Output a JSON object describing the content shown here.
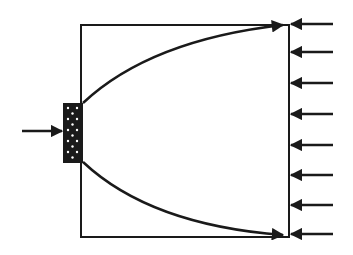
{
  "diagram": {
    "colors": {
      "stroke": "#1a1a1a",
      "background": "#ffffff",
      "dots": "#ffffff"
    },
    "box": {
      "x": 81,
      "y": 25,
      "width": 208,
      "height": 212
    },
    "source_block": {
      "x": 63,
      "y": 103,
      "width": 20,
      "height": 60,
      "pattern": "white-dots"
    },
    "input_arrow": {
      "x1": 22,
      "y1": 131,
      "x2": 62,
      "y2": 131
    },
    "curves": [
      {
        "name": "upper-ray",
        "start": [
          83,
          103
        ],
        "control": [
          150,
          40
        ],
        "end": [
          283,
          25
        ]
      },
      {
        "name": "lower-ray",
        "start": [
          83,
          162
        ],
        "control": [
          150,
          225
        ],
        "end": [
          283,
          235
        ]
      }
    ],
    "right_arrows_y": [
      24,
      52,
      83,
      114,
      145,
      175,
      205,
      234
    ],
    "right_arrows_x": {
      "from": 333,
      "to": 291
    }
  }
}
